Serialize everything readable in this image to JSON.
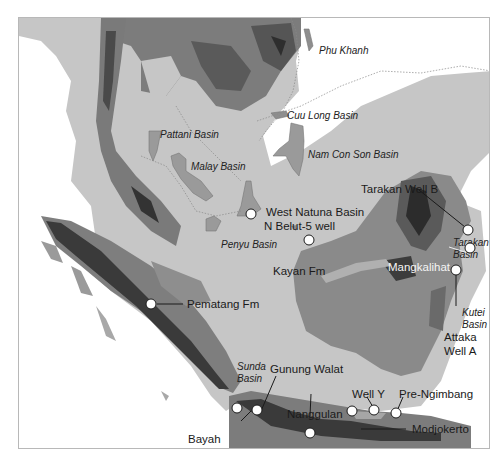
{
  "map": {
    "title": "",
    "colors": {
      "deep_sea": "#ffffff",
      "shelf": "#c6c6c6",
      "lowland": "#8e8e8e",
      "upland": "#6a6a6a",
      "highland": "#2a2a2a",
      "basin_fill": "#9a9a9a",
      "marker_fill": "#ffffff",
      "marker_stroke": "#1c1c1c"
    },
    "basins": [
      {
        "id": "phu-khanh",
        "label": "Phu Khanh"
      },
      {
        "id": "pattani",
        "label": "Pattani Basin"
      },
      {
        "id": "cuu-long",
        "label": "Cuu Long Basin"
      },
      {
        "id": "malay",
        "label": "Malay Basin"
      },
      {
        "id": "nam-con-son",
        "label": "Nam Con Son Basin"
      },
      {
        "id": "penyu",
        "label": "Penyu Basin"
      },
      {
        "id": "tarakan",
        "label": "Tarakan Basin"
      },
      {
        "id": "kutei",
        "label": "Kutei Basin"
      },
      {
        "id": "sunda",
        "label": "Sunda Basin"
      }
    ],
    "sites": [
      {
        "id": "west-natuna",
        "label": "West Natuna Basin"
      },
      {
        "id": "n-belut",
        "label": "N Belut-5 well"
      },
      {
        "id": "tarakan-well-b",
        "label": "Tarakan Well B"
      },
      {
        "id": "kayan",
        "label": "Kayan Fm"
      },
      {
        "id": "mangkalihat",
        "label": "Mangkalihat"
      },
      {
        "id": "attaka",
        "label": "Attaka Well A"
      },
      {
        "id": "pematang",
        "label": "Pematang Fm"
      },
      {
        "id": "gunung-walat",
        "label": "Gunung Walat"
      },
      {
        "id": "well-y",
        "label": "Well Y"
      },
      {
        "id": "pre-ngimbang",
        "label": "Pre-Ngimbang"
      },
      {
        "id": "nanggulan",
        "label": "Nanggulan"
      },
      {
        "id": "bayah",
        "label": "Bayah"
      },
      {
        "id": "modjokerto",
        "label": "Modjokerto"
      }
    ],
    "labels": {
      "tarakan_line1": "Tarakan",
      "tarakan_line2": "Basin",
      "kutei_line1": "Kutei",
      "kutei_line2": "Basin",
      "attaka_line1": "Attaka",
      "attaka_line2": "Well A",
      "sunda_line1": "Sunda",
      "sunda_line2": "Basin"
    }
  }
}
